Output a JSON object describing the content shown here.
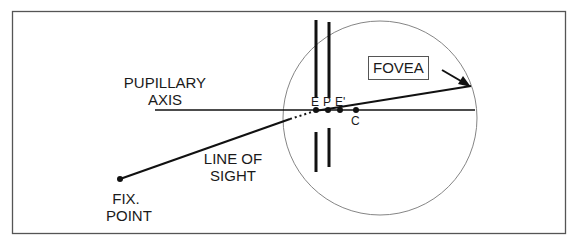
{
  "figure": {
    "labels": {
      "pupillary_axis_line1": "PUPILLARY",
      "pupillary_axis_line2": "AXIS",
      "line_of_sight_line1": "LINE OF",
      "line_of_sight_line2": "SIGHT",
      "fix_point_line1": "FIX.",
      "fix_point_line2": "POINT",
      "fovea": "FOVEA",
      "point_E": "E",
      "point_P": "P",
      "point_E_prime": "E'",
      "point_C": "C"
    }
  }
}
